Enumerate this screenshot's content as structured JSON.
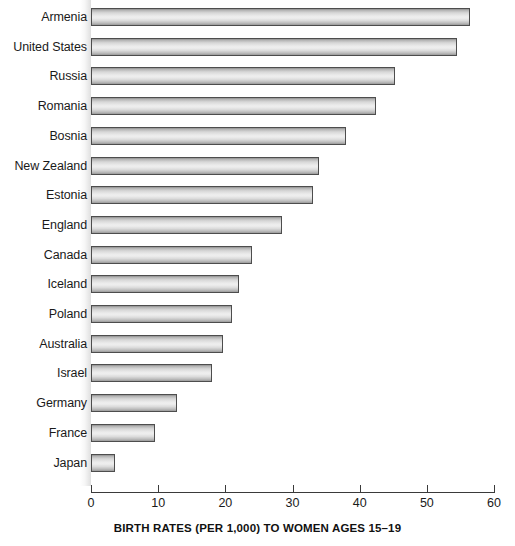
{
  "chart_data": {
    "type": "bar",
    "orientation": "horizontal",
    "title": "",
    "xlabel": "BIRTH RATES (PER 1,000) TO WOMEN AGES 15–19",
    "ylabel": "",
    "xlim": [
      0,
      60
    ],
    "xticks": [
      0,
      10,
      20,
      30,
      40,
      50,
      60
    ],
    "xtick_labels": [
      "0",
      "10",
      "20",
      "30",
      "40",
      "50",
      "60"
    ],
    "grid": false,
    "legend": null,
    "categories": [
      "Armenia",
      "United States",
      "Russia",
      "Romania",
      "Bosnia",
      "New Zealand",
      "Estonia",
      "England",
      "Canada",
      "Iceland",
      "Poland",
      "Australia",
      "Israel",
      "Germany",
      "France",
      "Japan"
    ],
    "values": [
      56.4,
      54.5,
      45.3,
      42.5,
      38.0,
      34.0,
      33.0,
      28.5,
      24.0,
      22.0,
      21.0,
      19.7,
      18.0,
      12.8,
      9.5,
      3.6
    ],
    "bar_color": "#e8e8e8",
    "bar_border_color": "#4d4d4d"
  }
}
